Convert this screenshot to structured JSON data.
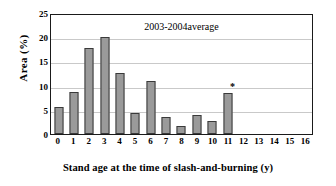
{
  "chart_data": {
    "type": "bar",
    "title": "",
    "annotation": "2003-2004average",
    "xlabel": "Stand age at the time of slash-and-burning  (y)",
    "ylabel": "Area  (%)",
    "categories": [
      "0",
      "1",
      "2",
      "3",
      "4",
      "5",
      "6",
      "7",
      "8",
      "9",
      "10",
      "11",
      "12",
      "13",
      "14",
      "15",
      "16"
    ],
    "values": [
      5.6,
      8.7,
      17.8,
      20.1,
      12.6,
      4.4,
      11.0,
      3.6,
      1.7,
      4.0,
      2.6,
      8.5,
      0,
      0,
      0,
      0,
      0
    ],
    "point_markers": [
      {
        "category": "11",
        "marker": "*"
      }
    ],
    "ylim": [
      0,
      25
    ],
    "yticks": [
      0,
      5,
      10,
      15,
      20,
      25
    ],
    "ytick_labels": [
      "0",
      "5",
      "10",
      "15",
      "20",
      "25"
    ],
    "xlim": [
      -0.5,
      16.5
    ],
    "grid": "horizontal",
    "legend": "none",
    "bar_color": "#9a9a9a",
    "bar_edge_color": "#3a3a3a",
    "frame_color": "#1a1a1a",
    "gridline_color": "#c9c9c9",
    "background": "#ffffff"
  }
}
